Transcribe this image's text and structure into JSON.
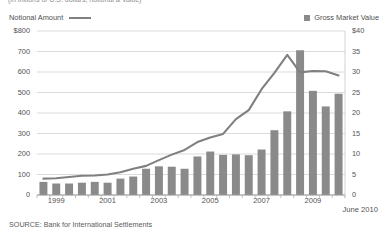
{
  "title": "(in trillions of U.S. dollars; notional & value)",
  "legend": {
    "left": {
      "label": "Notional Amount",
      "swatch": "line-swatch",
      "color": "#808080"
    },
    "right": {
      "label": "Gross Market Value",
      "swatch": "square-swatch",
      "color": "#8a8a8a"
    }
  },
  "source": "SOURCE: Bank for International Settlements",
  "end_label": "June 2010",
  "chart_data": {
    "type": "bar",
    "title": "(in trillions of U.S. dollars; notional & value)",
    "xlabel": "",
    "ylabel": "",
    "grid": true,
    "legend_position": "top",
    "x": [
      "1998 H2",
      "1999 H1",
      "1999 H2",
      "2000 H1",
      "2000 H2",
      "2001 H1",
      "2001 H2",
      "2002 H1",
      "2002 H2",
      "2003 H1",
      "2003 H2",
      "2004 H1",
      "2004 H2",
      "2005 H1",
      "2005 H2",
      "2006 H1",
      "2006 H2",
      "2007 H1",
      "2007 H2",
      "2008 H1",
      "2008 H2",
      "2009 H1",
      "2009 H2",
      "2010 H1"
    ],
    "tick_labels": [
      "1999",
      "2001",
      "2003",
      "2005",
      "2007",
      "2009"
    ],
    "tick_label_positions": [
      1.5,
      5.5,
      9.5,
      13.5,
      17.5,
      21.5
    ],
    "left_axis": {
      "label": "$800",
      "ticks": [
        "$800",
        "700",
        "600",
        "500",
        "400",
        "300",
        "200",
        "100",
        "0"
      ],
      "values": [
        800,
        700,
        600,
        500,
        400,
        300,
        200,
        100,
        0
      ],
      "ylim": [
        0,
        800
      ]
    },
    "right_axis": {
      "label": "$40",
      "ticks": [
        "$40",
        "35",
        "30",
        "25",
        "20",
        "15",
        "10",
        "5",
        "0"
      ],
      "values": [
        40,
        35,
        30,
        25,
        20,
        15,
        10,
        5,
        0
      ],
      "ylim": [
        0,
        40
      ]
    },
    "series": [
      {
        "name": "Gross Market Value",
        "type": "bar",
        "axis": "right",
        "color": "#8a8a8a",
        "values": [
          3.2,
          2.8,
          2.8,
          3.0,
          3.2,
          3.0,
          4.0,
          4.5,
          6.4,
          7.0,
          6.9,
          6.4,
          9.4,
          10.6,
          9.8,
          9.9,
          9.7,
          11.1,
          15.8,
          20.4,
          35.3,
          25.4,
          21.6,
          24.7
        ]
      },
      {
        "name": "Notional Amount",
        "type": "line",
        "axis": "left",
        "color": "#808080",
        "values": [
          80,
          82,
          88,
          94,
          95,
          100,
          111,
          128,
          142,
          170,
          197,
          220,
          258,
          281,
          298,
          370,
          414,
          516,
          596,
          684,
          598,
          605,
          604,
          583
        ]
      }
    ]
  }
}
